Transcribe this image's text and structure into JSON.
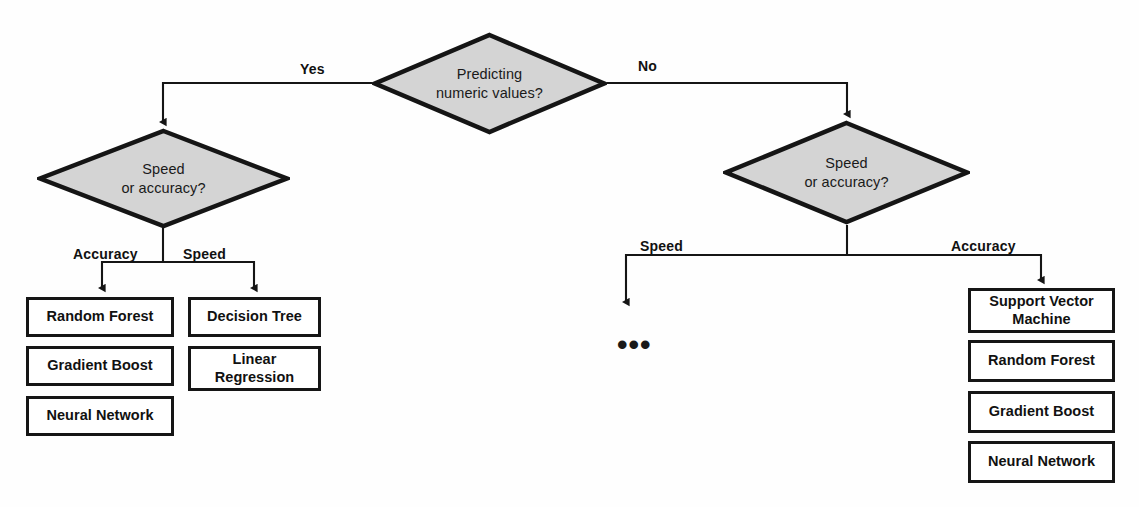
{
  "diagram": {
    "type": "flowchart",
    "background_color": "#fefefe",
    "node_fill": "#d4d4d4",
    "stroke_color": "#151515",
    "top_artifact": "",
    "decisions": [
      {
        "id": "root",
        "line1": "Predicting",
        "line2": "numeric values?",
        "cx": 489,
        "cy": 83
      },
      {
        "id": "left-speed-accuracy",
        "line1": "Speed",
        "line2": "or accuracy?",
        "cx": 163,
        "cy": 178
      },
      {
        "id": "right-speed-accuracy",
        "line1": "Speed",
        "line2": "or accuracy?",
        "cx": 847,
        "cy": 172
      }
    ],
    "edge_labels": [
      {
        "id": "yes",
        "text": "Yes",
        "x": 300,
        "y": 61
      },
      {
        "id": "no",
        "text": "No",
        "x": 638,
        "y": 58
      },
      {
        "id": "left-accuracy",
        "text": "Accuracy",
        "x": 73,
        "y": 246
      },
      {
        "id": "left-speed",
        "text": "Speed",
        "x": 183,
        "y": 246
      },
      {
        "id": "right-speed",
        "text": "Speed",
        "x": 640,
        "y": 238
      },
      {
        "id": "right-accuracy",
        "text": "Accuracy",
        "x": 951,
        "y": 238
      }
    ],
    "ellipsis": {
      "text": "•••",
      "x": 617,
      "y": 337
    },
    "branches": [
      {
        "id": "regression-accuracy",
        "label": "Accuracy",
        "boxes": [
          {
            "text": "Random Forest",
            "x": 26,
            "y": 297,
            "w": 148,
            "h": 40
          },
          {
            "text": "Gradient Boost",
            "x": 26,
            "y": 346,
            "w": 148,
            "h": 40
          },
          {
            "text": "Neural Network",
            "x": 26,
            "y": 396,
            "w": 148,
            "h": 40
          }
        ]
      },
      {
        "id": "regression-speed",
        "label": "Speed",
        "boxes": [
          {
            "text": "Decision Tree",
            "x": 188,
            "y": 297,
            "w": 133,
            "h": 40
          },
          {
            "text": "Linear\nRegression",
            "x": 188,
            "y": 346,
            "w": 133,
            "h": 45
          }
        ]
      },
      {
        "id": "classification-accuracy",
        "label": "Accuracy",
        "boxes": [
          {
            "text": "Support Vector\nMachine",
            "x": 968,
            "y": 288,
            "w": 147,
            "h": 45
          },
          {
            "text": "Random Forest",
            "x": 968,
            "y": 340,
            "w": 147,
            "h": 42
          },
          {
            "text": "Gradient Boost",
            "x": 968,
            "y": 391,
            "w": 147,
            "h": 42
          },
          {
            "text": "Neural Network",
            "x": 968,
            "y": 441,
            "w": 147,
            "h": 42
          }
        ]
      }
    ]
  }
}
